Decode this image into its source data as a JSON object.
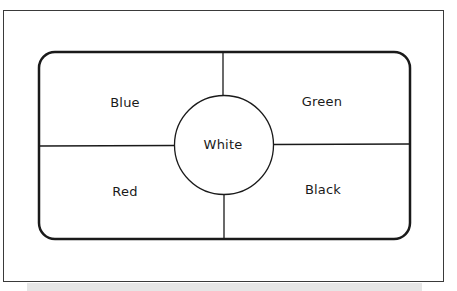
{
  "diagram": {
    "type": "quadrant-with-center-circle",
    "quadrants": {
      "top_left": {
        "label": "Blue"
      },
      "top_right": {
        "label": "Green"
      },
      "bottom_left": {
        "label": "Red"
      },
      "bottom_right": {
        "label": "Black"
      }
    },
    "center": {
      "label": "White"
    },
    "colors": {
      "stroke": "#1a1a1a",
      "frame": "#3a3a3a",
      "background": "#ffffff",
      "shadow": "#e6e6e6"
    }
  }
}
